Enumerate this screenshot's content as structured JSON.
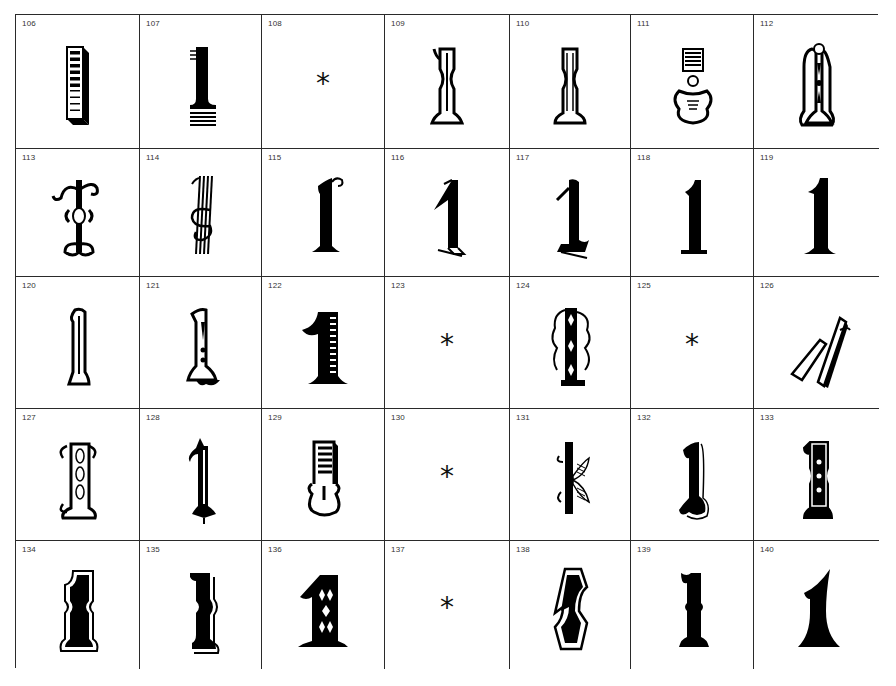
{
  "sheet": {
    "rows": 5,
    "columns": 7,
    "cells": [
      {
        "number": "106",
        "glyph": "1",
        "style": "striped-3d-block"
      },
      {
        "number": "107",
        "glyph": "1",
        "style": "bar-with-stripes"
      },
      {
        "number": "108",
        "glyph": "*",
        "style": "asterisk"
      },
      {
        "number": "109",
        "glyph": "1",
        "style": "tuscan-shaded"
      },
      {
        "number": "110",
        "glyph": "1",
        "style": "tuscan-lined"
      },
      {
        "number": "111",
        "glyph": "1",
        "style": "ornate-scroll"
      },
      {
        "number": "112",
        "glyph": "1",
        "style": "circus-dotted"
      },
      {
        "number": "113",
        "glyph": "1",
        "style": "curl-outline"
      },
      {
        "number": "114",
        "glyph": "1",
        "style": "multiline-swash"
      },
      {
        "number": "115",
        "glyph": "1",
        "style": "serif-curl"
      },
      {
        "number": "116",
        "glyph": "1",
        "style": "shadow-serif"
      },
      {
        "number": "117",
        "glyph": "1",
        "style": "blackletter"
      },
      {
        "number": "118",
        "glyph": "1",
        "style": "plain-serif"
      },
      {
        "number": "119",
        "glyph": "1",
        "style": "plain-serif-heavy"
      },
      {
        "number": "120",
        "glyph": "1",
        "style": "outline-tall"
      },
      {
        "number": "121",
        "glyph": "1",
        "style": "circus-shadow"
      },
      {
        "number": "122",
        "glyph": "1",
        "style": "lined-bold"
      },
      {
        "number": "123",
        "glyph": "*",
        "style": "asterisk"
      },
      {
        "number": "124",
        "glyph": "1",
        "style": "filigree"
      },
      {
        "number": "125",
        "glyph": "*",
        "style": "asterisk"
      },
      {
        "number": "126",
        "glyph": "1",
        "style": "italic-3d"
      },
      {
        "number": "127",
        "glyph": "1",
        "style": "ornate-leaf"
      },
      {
        "number": "128",
        "glyph": "1",
        "style": "spiked-ornate"
      },
      {
        "number": "129",
        "glyph": "1",
        "style": "striped-scroll"
      },
      {
        "number": "130",
        "glyph": "*",
        "style": "asterisk"
      },
      {
        "number": "131",
        "glyph": "1",
        "style": "hatched-wing"
      },
      {
        "number": "132",
        "glyph": "1",
        "style": "shadow-curve"
      },
      {
        "number": "133",
        "glyph": "1",
        "style": "outlined-dots"
      },
      {
        "number": "134",
        "glyph": "1",
        "style": "outlined-tuscan"
      },
      {
        "number": "135",
        "glyph": "1",
        "style": "shadow-tuscan"
      },
      {
        "number": "136",
        "glyph": "1",
        "style": "bold-cutout"
      },
      {
        "number": "137",
        "glyph": "*",
        "style": "asterisk"
      },
      {
        "number": "138",
        "glyph": "1",
        "style": "double-outline"
      },
      {
        "number": "139",
        "glyph": "1",
        "style": "tuscan-bold"
      },
      {
        "number": "140",
        "glyph": "1",
        "style": "flared-bold"
      }
    ]
  }
}
